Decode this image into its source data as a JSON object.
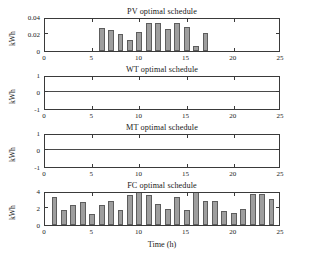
{
  "figure": {
    "xlabel": "Time (h)",
    "background": "#ffffff",
    "bar_color": "#9e9e9e",
    "bar_edge_color": "#5d5d5d",
    "axis_color": "#3a3a3a"
  },
  "panels": [
    {
      "key": "pv",
      "title": "PV optimal schedule",
      "ylabel": "kWh",
      "yticks": [
        "0",
        "0.02",
        "0.04"
      ],
      "xticks": [
        "0",
        "5",
        "10",
        "15",
        "20",
        "25"
      ]
    },
    {
      "key": "wt",
      "title": "WT optimal schedule",
      "ylabel": "kWh",
      "yticks": [
        "-1",
        "0",
        "1"
      ],
      "xticks": [
        "0",
        "5",
        "10",
        "15",
        "20",
        "25"
      ]
    },
    {
      "key": "mt",
      "title": "MT optimal schedule",
      "ylabel": "kWh",
      "yticks": [
        "-1",
        "0",
        "1"
      ],
      "xticks": [
        "0",
        "5",
        "10",
        "15",
        "20",
        "25"
      ]
    },
    {
      "key": "fc",
      "title": "FC optimal schedule",
      "ylabel": "kWh",
      "yticks": [
        "0",
        "2",
        "4"
      ],
      "xticks": [
        "0",
        "5",
        "10",
        "15",
        "20",
        "25"
      ]
    }
  ],
  "chart_data": [
    {
      "type": "bar",
      "id": "pv",
      "title": "PV optimal schedule",
      "xlabel": "Time (h)",
      "ylabel": "kWh",
      "xlim": [
        0,
        25
      ],
      "ylim": [
        0,
        0.04
      ],
      "xticks": [
        0,
        5,
        10,
        15,
        20,
        25
      ],
      "yticks": [
        0,
        0.02,
        0.04
      ],
      "grid": false,
      "legend": null,
      "x": [
        1,
        2,
        3,
        4,
        5,
        6,
        7,
        8,
        9,
        10,
        11,
        12,
        13,
        14,
        15,
        16,
        17,
        18,
        19,
        20,
        21,
        22,
        23,
        24
      ],
      "values": [
        0,
        0,
        0,
        0,
        0,
        0.027,
        0.0245,
        0.0195,
        0.0125,
        0.022,
        0.0335,
        0.0335,
        0.0255,
        0.033,
        0.0285,
        0.006,
        0.0215,
        0,
        0,
        0,
        0,
        0,
        0,
        0
      ]
    },
    {
      "type": "bar",
      "id": "wt",
      "title": "WT optimal schedule",
      "xlabel": "Time (h)",
      "ylabel": "kWh",
      "xlim": [
        0,
        25
      ],
      "ylim": [
        -1,
        1
      ],
      "xticks": [
        0,
        5,
        10,
        15,
        20,
        25
      ],
      "yticks": [
        -1,
        0,
        1
      ],
      "grid": false,
      "legend": null,
      "x": [
        1,
        2,
        3,
        4,
        5,
        6,
        7,
        8,
        9,
        10,
        11,
        12,
        13,
        14,
        15,
        16,
        17,
        18,
        19,
        20,
        21,
        22,
        23,
        24
      ],
      "values": [
        0,
        0,
        0,
        0,
        0,
        0,
        0,
        0,
        0,
        0,
        0,
        0,
        0,
        0,
        0,
        0,
        0,
        0,
        0,
        0,
        0,
        0,
        0,
        0
      ]
    },
    {
      "type": "bar",
      "id": "mt",
      "title": "MT optimal schedule",
      "xlabel": "Time (h)",
      "ylabel": "kWh",
      "xlim": [
        0,
        25
      ],
      "ylim": [
        -1,
        1
      ],
      "xticks": [
        0,
        5,
        10,
        15,
        20,
        25
      ],
      "yticks": [
        -1,
        0,
        1
      ],
      "grid": false,
      "legend": null,
      "x": [
        1,
        2,
        3,
        4,
        5,
        6,
        7,
        8,
        9,
        10,
        11,
        12,
        13,
        14,
        15,
        16,
        17,
        18,
        19,
        20,
        21,
        22,
        23,
        24
      ],
      "values": [
        0,
        0,
        0,
        0,
        0,
        0,
        0,
        0,
        0,
        0,
        0,
        0,
        0,
        0,
        0,
        0,
        0,
        0,
        0,
        0,
        0,
        0,
        0,
        0
      ]
    },
    {
      "type": "bar",
      "id": "fc",
      "title": "FC optimal schedule",
      "xlabel": "Time (h)",
      "ylabel": "kWh",
      "xlim": [
        0,
        25
      ],
      "ylim": [
        0,
        4
      ],
      "xticks": [
        0,
        5,
        10,
        15,
        20,
        25
      ],
      "yticks": [
        0,
        2,
        4
      ],
      "grid": false,
      "legend": null,
      "x": [
        1,
        2,
        3,
        4,
        5,
        6,
        7,
        8,
        9,
        10,
        11,
        12,
        13,
        14,
        15,
        16,
        17,
        18,
        19,
        20,
        21,
        22,
        23,
        24
      ],
      "values": [
        3.35,
        1.8,
        2.3,
        2.65,
        1.25,
        2.4,
        2.85,
        1.75,
        3.5,
        4.0,
        3.55,
        2.5,
        1.9,
        3.25,
        1.75,
        4.0,
        2.8,
        2.8,
        1.6,
        1.4,
        1.85,
        3.6,
        3.7,
        3.05
      ]
    }
  ]
}
